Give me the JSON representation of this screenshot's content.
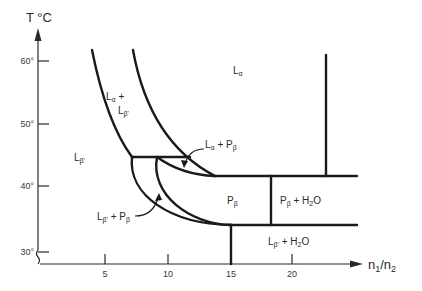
{
  "diagram": {
    "type": "phase-diagram",
    "y_axis": {
      "label": "T °C",
      "ticks": [
        "30°",
        "40°",
        "50°",
        "60°"
      ]
    },
    "x_axis": {
      "label_main": "n",
      "label_sub1": "1",
      "label_slash": "/n",
      "label_sub2": "2",
      "ticks": [
        "5",
        "10",
        "15",
        "20"
      ]
    },
    "regions": {
      "l_alpha": {
        "main": "L",
        "sub": "α"
      },
      "l_alpha_plus_l_beta_prime": {
        "line1_main": "L",
        "line1_sub": "α",
        "line1_rest": " +",
        "line2_main": "L",
        "line2_sub": "β'"
      },
      "l_beta_prime": {
        "main": "L",
        "sub": "β'"
      },
      "l_alpha_plus_p_beta": {
        "main1": "L",
        "sub1": "α",
        "mid": " + P",
        "sub2": "β"
      },
      "l_beta_prime_plus_p_beta": {
        "main1": "L",
        "sub1": "β'",
        "mid": " + P",
        "sub2": "β"
      },
      "p_beta": {
        "main": "P",
        "sub": "β"
      },
      "p_beta_plus_h2o": {
        "main": "P",
        "sub": "β",
        "mid": " + H",
        "sub2": "2",
        "end": "O"
      },
      "l_beta_prime_plus_h2o": {
        "main": "L",
        "sub": "β'",
        "mid": " + H",
        "sub2": "2",
        "end": "O"
      }
    }
  }
}
